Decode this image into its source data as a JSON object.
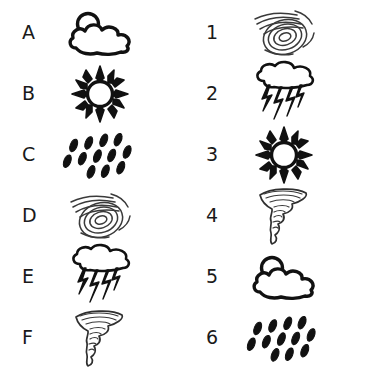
{
  "worksheet": {
    "title": "Weather Icon Matching Worksheet",
    "background_color": "#ffffff",
    "ink_color": "#1a1a1a"
  },
  "left_column": {
    "name": "lettered-column",
    "items": [
      {
        "label": "A",
        "icon": "sun-behind-cloud-icon",
        "icon_name": "partly cloudy"
      },
      {
        "label": "B",
        "icon": "sun-icon",
        "icon_name": "sunny"
      },
      {
        "label": "C",
        "icon": "rain-icon",
        "icon_name": "rain"
      },
      {
        "label": "D",
        "icon": "hurricane-icon",
        "icon_name": "hurricane"
      },
      {
        "label": "E",
        "icon": "thunderstorm-icon",
        "icon_name": "thunderstorm"
      },
      {
        "label": "F",
        "icon": "tornado-icon",
        "icon_name": "tornado"
      }
    ]
  },
  "right_column": {
    "name": "numbered-column",
    "items": [
      {
        "label": "1",
        "icon": "hurricane-icon",
        "icon_name": "hurricane"
      },
      {
        "label": "2",
        "icon": "thunderstorm-icon",
        "icon_name": "thunderstorm"
      },
      {
        "label": "3",
        "icon": "sun-icon",
        "icon_name": "sunny"
      },
      {
        "label": "4",
        "icon": "tornado-icon",
        "icon_name": "tornado"
      },
      {
        "label": "5",
        "icon": "sun-behind-cloud-icon",
        "icon_name": "partly cloudy"
      },
      {
        "label": "6",
        "icon": "rain-icon",
        "icon_name": "rain"
      }
    ]
  }
}
